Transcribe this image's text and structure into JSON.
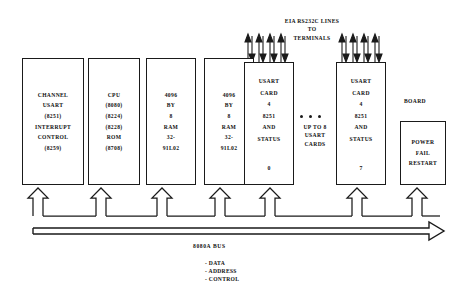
{
  "diagram": {
    "title_note": "8080A microcomputer multi-channel USART block diagram",
    "top_label": {
      "line1": "EIA RS232C LINES",
      "line2": "TO",
      "line3": "TERMINALS"
    },
    "middle_note": {
      "line1": "UP TO 8",
      "line2": "USART",
      "line3": "CARDS"
    },
    "board_label": "BOARD",
    "bus": {
      "name": "8080A  BUS",
      "signals": [
        "- DATA",
        "- ADDRESS",
        "- CONTROL"
      ]
    },
    "boxes": [
      {
        "id": "channel-usart-interrupt-control",
        "lines": [
          "CHANNEL",
          "USART",
          "(8251)",
          "INTERRUPT",
          "CONTROL",
          "(8259)"
        ]
      },
      {
        "id": "cpu",
        "lines": [
          "CPU",
          "(8080)",
          "(8224)",
          "(8228)",
          "ROM",
          "(8708)"
        ]
      },
      {
        "id": "ram-1",
        "lines": [
          "4096",
          "BY",
          "8",
          "RAM",
          "32-",
          "91L02"
        ]
      },
      {
        "id": "ram-2",
        "lines": [
          "4096",
          "BY",
          "8",
          "RAM",
          "32-",
          "91L02"
        ]
      },
      {
        "id": "usart-card-0",
        "lines": [
          "USART",
          "CARD",
          "4",
          "8251",
          "AND",
          "STATUS"
        ],
        "index": "0"
      },
      {
        "id": "usart-card-7",
        "lines": [
          "USART",
          "CARD",
          "4",
          "8251",
          "AND",
          "STATUS"
        ],
        "index": "7"
      },
      {
        "id": "power-fail-restart",
        "lines": [
          "POWER",
          "FAIL",
          "RESTART"
        ]
      }
    ],
    "colors": {
      "ink": "#1a1a1a",
      "paper": "#ffffff"
    }
  }
}
